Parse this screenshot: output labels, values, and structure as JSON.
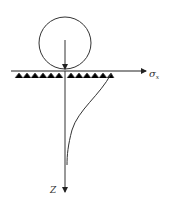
{
  "diagram": {
    "labels": {
      "x_axis": "σ",
      "x_axis_sub": "x",
      "z_axis": "Z"
    },
    "elements": {
      "circle": {
        "cx": 65,
        "cy": 43,
        "r": 27
      },
      "load_arrow": {
        "x": 65,
        "y1": 40,
        "y2": 71
      },
      "surface_line": {
        "x1": 11,
        "x2": 146,
        "y": 71
      },
      "z_axis": {
        "x": 65,
        "y1": 71,
        "y2": 193
      },
      "stress_curve": "M 111 74 C 100 95, 78 110, 72 130 C 68 145, 67 155, 67 165"
    },
    "colors": {
      "stroke": "#333333",
      "background": "#ffffff"
    }
  }
}
